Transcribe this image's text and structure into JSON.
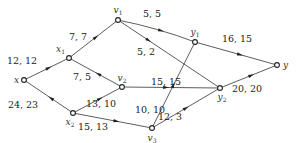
{
  "diagram": {
    "type": "network-flow",
    "nodes": [
      {
        "id": "x",
        "label": "x",
        "sub": ""
      },
      {
        "id": "x1",
        "label": "x",
        "sub": "1"
      },
      {
        "id": "x2",
        "label": "x",
        "sub": "2"
      },
      {
        "id": "v1",
        "label": "v",
        "sub": "1"
      },
      {
        "id": "v2",
        "label": "v",
        "sub": "2"
      },
      {
        "id": "v3",
        "label": "v",
        "sub": "3"
      },
      {
        "id": "y1",
        "label": "y",
        "sub": "1"
      },
      {
        "id": "y2",
        "label": "y",
        "sub": "2"
      },
      {
        "id": "y",
        "label": "y",
        "sub": ""
      }
    ],
    "edges": [
      {
        "from": "x",
        "to": "x1",
        "label": "12, 12"
      },
      {
        "from": "x2",
        "to": "x",
        "label": "24, 23"
      },
      {
        "from": "x1",
        "to": "v1",
        "label": "7, 7"
      },
      {
        "from": "v2",
        "to": "x1",
        "label": "7, 5"
      },
      {
        "from": "v1",
        "to": "y1",
        "label": "5, 5"
      },
      {
        "from": "v1",
        "to": "y2",
        "label": "5, 2"
      },
      {
        "from": "y1",
        "to": "y",
        "label": "16, 15"
      },
      {
        "from": "x2",
        "to": "v2",
        "label": "13, 10"
      },
      {
        "from": "x2",
        "to": "v3",
        "label": "15, 13"
      },
      {
        "from": "v2",
        "to": "y2",
        "label": "15, 15"
      },
      {
        "from": "v3",
        "to": "y1",
        "label": "10, 10"
      },
      {
        "from": "v3",
        "to": "y2",
        "label": "12, 3"
      },
      {
        "from": "y2",
        "to": "y",
        "label": "20, 20"
      }
    ]
  }
}
